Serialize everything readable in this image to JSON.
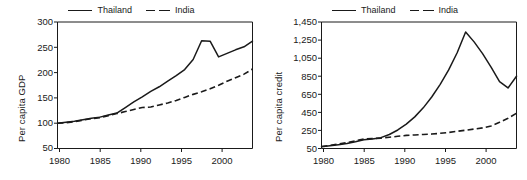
{
  "figure": {
    "background": "#ffffff",
    "ink": "#1a1a1a",
    "panel_count": 2
  },
  "chart_data": [
    {
      "type": "line",
      "panel": "left",
      "title": "",
      "xlabel": "",
      "ylabel": "Per capita GDP",
      "xlim": [
        1980,
        2003
      ],
      "ylim": [
        50,
        300
      ],
      "grid": false,
      "legend_position": "top-center",
      "xticks": [
        1980,
        1985,
        1990,
        1995,
        2000
      ],
      "xtick_labels": [
        "1980",
        "1985",
        "1990",
        "1995",
        "2000"
      ],
      "yticks": [
        50,
        100,
        150,
        200,
        250,
        300
      ],
      "ytick_labels": [
        "50",
        "100",
        "150",
        "200",
        "250",
        "300"
      ],
      "x": [
        1980,
        1981,
        1982,
        1983,
        1984,
        1985,
        1986,
        1987,
        1988,
        1989,
        1990,
        1991,
        1992,
        1993,
        1994,
        1995,
        1996,
        1997,
        1998,
        1999,
        2000,
        2001,
        2002,
        2003
      ],
      "series": [
        {
          "name": "Thailand",
          "style": "solid",
          "values": [
            100,
            102,
            104,
            107,
            110,
            112,
            116,
            120,
            131,
            142,
            152,
            163,
            172,
            183,
            194,
            206,
            226,
            263,
            262,
            231,
            238,
            245,
            251,
            262
          ]
        },
        {
          "name": "India",
          "style": "dashed",
          "values": [
            100,
            101,
            103,
            106,
            109,
            111,
            115,
            119,
            123,
            127,
            131,
            132,
            136,
            140,
            145,
            151,
            157,
            162,
            168,
            175,
            183,
            190,
            197,
            207
          ]
        }
      ]
    },
    {
      "type": "line",
      "panel": "right",
      "title": "",
      "xlabel": "",
      "ylabel": "Per capita credit",
      "xlim": [
        1980,
        2003
      ],
      "ylim": [
        50,
        1450
      ],
      "grid": false,
      "legend_position": "top-center",
      "xticks": [
        1980,
        1985,
        1990,
        1995,
        2000
      ],
      "xtick_labels": [
        "1980",
        "1985",
        "1990",
        "1995",
        "2000"
      ],
      "yticks": [
        50,
        250,
        450,
        650,
        850,
        1050,
        1250,
        1450
      ],
      "ytick_labels": [
        "50",
        "250",
        "450",
        "650",
        "850",
        "1,050",
        "1,250",
        "1,450"
      ],
      "x": [
        1980,
        1981,
        1982,
        1983,
        1984,
        1985,
        1986,
        1987,
        1988,
        1989,
        1990,
        1991,
        1992,
        1993,
        1994,
        1995,
        1996,
        1997,
        1998,
        1999,
        2000,
        2001,
        2002,
        2003
      ],
      "series": [
        {
          "name": "Thailand",
          "style": "solid",
          "values": [
            70,
            80,
            92,
            105,
            125,
            148,
            155,
            170,
            205,
            255,
            320,
            400,
            500,
            620,
            760,
            920,
            1110,
            1340,
            1230,
            1100,
            950,
            790,
            720,
            850
          ]
        },
        {
          "name": "India",
          "style": "dashed",
          "values": [
            72,
            85,
            100,
            115,
            135,
            155,
            160,
            165,
            175,
            185,
            195,
            200,
            205,
            210,
            218,
            228,
            240,
            252,
            265,
            278,
            300,
            340,
            385,
            440
          ]
        }
      ]
    }
  ],
  "panels": [
    {
      "name": "per-capita-gdp",
      "ylabel": "Per capita GDP",
      "legend": [
        {
          "label": "Thailand",
          "style": "solid"
        },
        {
          "label": "India",
          "style": "dashed"
        }
      ]
    },
    {
      "name": "per-capita-credit",
      "ylabel": "Per capita credit",
      "legend": [
        {
          "label": "Thailand",
          "style": "solid"
        },
        {
          "label": "India",
          "style": "dashed"
        }
      ]
    }
  ]
}
